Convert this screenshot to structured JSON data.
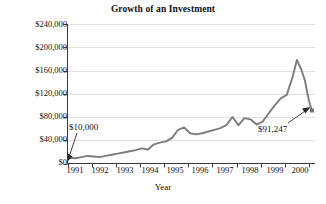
{
  "chart_data": {
    "type": "line",
    "title": "Growth of an Investment",
    "xlabel": "Year",
    "ylabel": "",
    "ylim": [
      0,
      240000
    ],
    "xlim": [
      1990.5,
      2000.75
    ],
    "grid": true,
    "legend": false,
    "ytick_labels": [
      "$240,000",
      "$200,000",
      "$160,000",
      "$120,000",
      "$80,000",
      "$40,000",
      "$0"
    ],
    "ytick_values": [
      240000,
      200000,
      160000,
      120000,
      80000,
      40000,
      0
    ],
    "xtick_labels": [
      "1991",
      "1992",
      "1993",
      "1994",
      "1995",
      "1996",
      "1997",
      "1998",
      "1999",
      "2000"
    ],
    "xtick_values": [
      1991,
      1992,
      1993,
      1994,
      1995,
      1996,
      1997,
      1998,
      1999,
      2000
    ],
    "series": [
      {
        "name": "Investment value",
        "color": "#7d7d7d",
        "x": [
          1990.58,
          1990.83,
          1991.08,
          1991.33,
          1991.58,
          1991.83,
          1992.08,
          1992.33,
          1992.58,
          1992.83,
          1993.08,
          1993.33,
          1993.58,
          1993.83,
          1994.08,
          1994.33,
          1994.58,
          1994.83,
          1995.08,
          1995.33,
          1995.58,
          1995.83,
          1996.08,
          1996.33,
          1996.58,
          1996.83,
          1997.08,
          1997.33,
          1997.58,
          1997.83,
          1998.08,
          1998.33,
          1998.58,
          1998.83,
          1999.08,
          1999.33,
          1999.58,
          1999.83,
          2000.0,
          2000.17,
          2000.33,
          2000.5,
          2000.62
        ],
        "y": [
          10000,
          9000,
          11000,
          13000,
          12000,
          11000,
          13000,
          15000,
          17000,
          19000,
          21000,
          23000,
          26000,
          24000,
          33000,
          36000,
          38000,
          44000,
          58000,
          62000,
          52000,
          50000,
          52000,
          55000,
          58000,
          61000,
          66000,
          80000,
          66000,
          78000,
          76000,
          67000,
          72000,
          86000,
          100000,
          112000,
          118000,
          150000,
          178000,
          163000,
          143000,
          108000,
          91247
        ]
      }
    ],
    "annotations": [
      {
        "name": "start-value",
        "text": "$10,000",
        "value": 10000,
        "points_to_year": 1990.6
      },
      {
        "name": "end-value",
        "text": "$91,247",
        "value": 91247,
        "points_to_year": 2000.62
      }
    ]
  }
}
